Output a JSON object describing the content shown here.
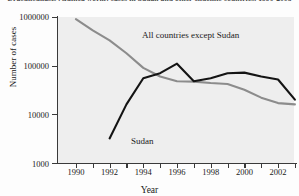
{
  "chart_data": {
    "type": "line",
    "title": "Dracunculiasis (Guinea worm) cases in Sudan and other endemic countries, 1990-2003",
    "xlabel": "Year",
    "ylabel": "Number of cases",
    "yscale": "log",
    "ylim": [
      1000,
      1000000
    ],
    "ytick_labels": [
      "1000000",
      "100000",
      "10000",
      "1000"
    ],
    "ytick_values": [
      1000000,
      100000,
      10000,
      1000
    ],
    "xlim": [
      1989,
      2003
    ],
    "xtick_values": [
      1990,
      1991,
      1992,
      1993,
      1994,
      1995,
      1996,
      1997,
      1998,
      1999,
      2000,
      2001,
      2002,
      2003
    ],
    "xtick_labels": [
      "1990",
      "",
      "1992",
      "",
      "1994",
      "",
      "1996",
      "",
      "1998",
      "",
      "2000",
      "",
      "2002",
      ""
    ],
    "grid": false,
    "legend": "annotations-inline",
    "x": [
      1990,
      1991,
      1992,
      1993,
      1994,
      1995,
      1996,
      1997,
      1998,
      1999,
      2000,
      2001,
      2002,
      2003
    ],
    "series": [
      {
        "name": "All countries except Sudan",
        "color": "#8c8c8c",
        "values": [
          900000,
          530000,
          330000,
          180000,
          90000,
          60000,
          48000,
          47000,
          44000,
          42000,
          32000,
          22000,
          17000,
          16000
        ]
      },
      {
        "name": "Sudan",
        "color": "#141414",
        "values": [
          null,
          null,
          3200,
          16000,
          55000,
          70000,
          110000,
          48000,
          55000,
          70000,
          72000,
          60000,
          52000,
          20000
        ]
      }
    ],
    "annotations": [
      {
        "text": "All countries except Sudan",
        "x": 1995,
        "y": 300000
      },
      {
        "text": "Sudan",
        "x": 1994,
        "y": 3600
      }
    ]
  }
}
